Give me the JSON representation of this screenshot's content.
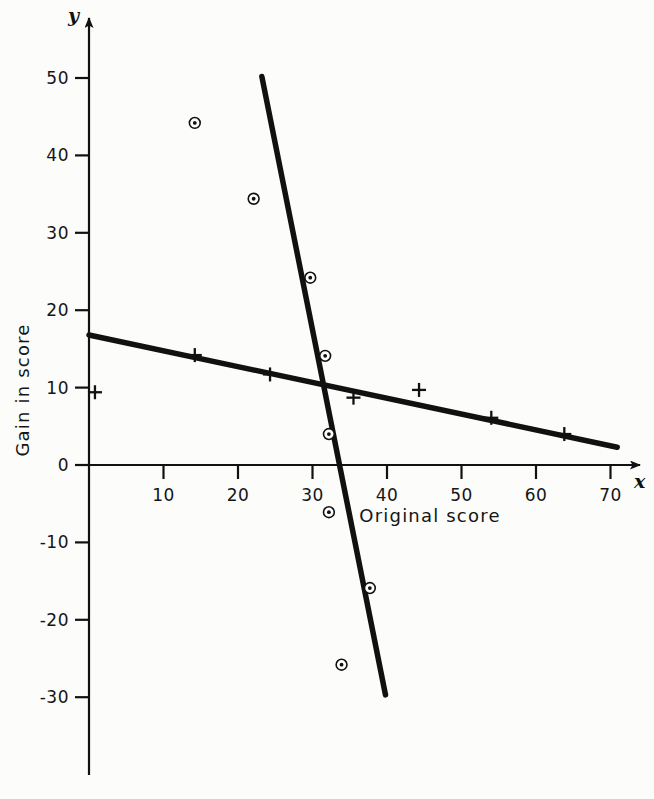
{
  "chart_data": {
    "type": "scatter",
    "title": "",
    "xlabel": "Original score",
    "ylabel": "Gain in score",
    "x_axis_letter": "x",
    "y_axis_letter": "y",
    "xlim": [
      0,
      74
    ],
    "ylim": [
      -34,
      54
    ],
    "grid": false,
    "legend": null,
    "xticks": [
      10,
      20,
      30,
      40,
      50,
      60,
      70
    ],
    "xtick_labels": [
      "10",
      "20",
      "30",
      "40",
      "50",
      "60",
      "70"
    ],
    "yticks": [
      -30,
      -20,
      -10,
      0,
      10,
      20,
      30,
      40,
      50
    ],
    "ytick_labels": [
      "-30",
      "-20",
      "-10",
      "0",
      "10",
      "20",
      "30",
      "40",
      "50"
    ],
    "series": [
      {
        "name": "circled-dot group",
        "marker": "circled-dot",
        "points": [
          {
            "x": 14.2,
            "y": 44.2
          },
          {
            "x": 22.1,
            "y": 34.4
          },
          {
            "x": 29.7,
            "y": 24.2
          },
          {
            "x": 31.7,
            "y": 14.1
          },
          {
            "x": 32.2,
            "y": 4.0
          },
          {
            "x": 32.2,
            "y": -6.1
          },
          {
            "x": 37.7,
            "y": -15.9
          },
          {
            "x": 33.9,
            "y": -25.8
          }
        ]
      },
      {
        "name": "plus group",
        "marker": "plus",
        "points": [
          {
            "x": 0.8,
            "y": 9.4
          },
          {
            "x": 14.2,
            "y": 14.2
          },
          {
            "x": 24.3,
            "y": 11.7
          },
          {
            "x": 35.5,
            "y": 8.7
          },
          {
            "x": 44.3,
            "y": 9.7
          },
          {
            "x": 54.0,
            "y": 6.1
          },
          {
            "x": 63.8,
            "y": 4.0
          }
        ]
      }
    ],
    "lines": [
      {
        "name": "steep-regression-line",
        "x1": 23.2,
        "y1": 50.2,
        "x2": 39.8,
        "y2": -29.7
      },
      {
        "name": "shallow-regression-line",
        "x1": 0.0,
        "y1": 16.8,
        "x2": 70.9,
        "y2": 2.3
      }
    ]
  }
}
